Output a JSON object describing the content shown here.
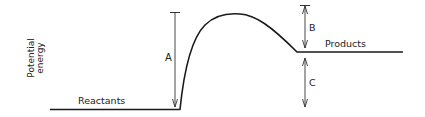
{
  "diagram": {
    "y_axis_label_line1": "Potential",
    "y_axis_label_line2": "energy",
    "reactants_label": "Reactants",
    "products_label": "Products",
    "arrow_a_label": "A",
    "arrow_b_label": "B",
    "arrow_c_label": "C",
    "line_color": "#1a1a1a",
    "text_color": "#222222"
  }
}
